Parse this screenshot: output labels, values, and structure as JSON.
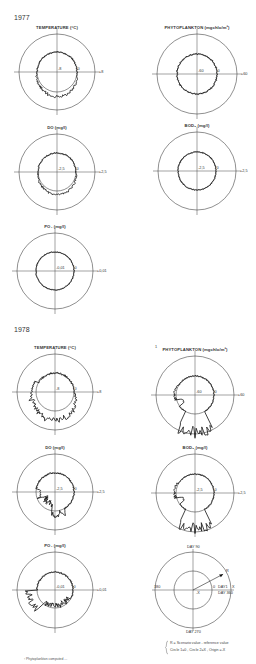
{
  "sections": [
    {
      "year": "1977",
      "y": 14
    },
    {
      "year": "1978",
      "y": 326
    }
  ],
  "panels": [
    {
      "id": "t77",
      "title": "TEMPERATURE (°C)",
      "cx": 57,
      "cy": 72,
      "r": 38,
      "ri": 20,
      "neg": "-8",
      "zero": "0",
      "pos": "+8",
      "shape": "mild_low",
      "amp": 4
    },
    {
      "id": "p77",
      "title": "PHYTOPLANKTON (mgchlo/m³)",
      "cx": 197,
      "cy": 74,
      "r": 40,
      "ri": 20,
      "neg": "-60",
      "zero": "0",
      "pos": "+60",
      "shape": "flat",
      "amp": 1.5
    },
    {
      "id": "d77",
      "title": "DO (mg/l)",
      "cx": 57,
      "cy": 172,
      "r": 38,
      "ri": 19,
      "neg": "-2,5",
      "zero": "0",
      "pos": "+2,5",
      "shape": "mild_low",
      "amp": 3
    },
    {
      "id": "b77",
      "title": "BOD₅ (mg/l)",
      "cx": 197,
      "cy": 171,
      "r": 39,
      "ri": 19,
      "neg": "-2,5",
      "zero": "0",
      "pos": "+2,5",
      "shape": "flat",
      "amp": 1
    },
    {
      "id": "o77",
      "title": "PO₄ (mg/l)",
      "cx": 55,
      "cy": 271,
      "r": 38,
      "ri": 19,
      "neg": "-0,01",
      "zero": "0",
      "pos": "+0,01",
      "shape": "flat",
      "amp": 1
    },
    {
      "id": "t78",
      "title": "TEMPERATURE (°C)",
      "cx": 55,
      "cy": 392,
      "r": 38,
      "ri": 19,
      "neg": "-8",
      "zero": "0",
      "pos": "+8",
      "shape": "big_low",
      "amp": 10
    },
    {
      "id": "p78",
      "title": "PHYTOPLANKTON (mgchlo/m³)",
      "cx": 195,
      "cy": 395,
      "r": 39,
      "ri": 19,
      "neg": "-60",
      "zero": "0",
      "pos": "+60",
      "shape": "spike",
      "amp": 20,
      "footmark": "1"
    },
    {
      "id": "d78",
      "title": "DO (mg/l)",
      "cx": 55,
      "cy": 492,
      "r": 38,
      "ri": 19,
      "neg": "-2,5",
      "zero": "0",
      "pos": "+2,5",
      "shape": "in_spike",
      "amp": 10
    },
    {
      "id": "b78",
      "title": "BOD₅ (mg/l)",
      "cx": 195,
      "cy": 493,
      "r": 39,
      "ri": 19,
      "neg": "-2,5",
      "zero": "0",
      "pos": "+2,5",
      "shape": "spike",
      "amp": 18
    },
    {
      "id": "o78",
      "title": "PO₄ (mg/l)",
      "cx": 55,
      "cy": 590,
      "r": 38,
      "ri": 18,
      "neg": "-0,01",
      "zero": "0",
      "pos": "+0,01",
      "shape": "po4",
      "amp": 15
    }
  ],
  "legend": {
    "cx": 193,
    "cy": 590,
    "r": 38,
    "ri": 19,
    "day90": "DAY 90",
    "day180": "180",
    "day270": "DAY 270",
    "day1": "DAY1",
    "day360": "DAY 360",
    "r_label": "R",
    "x_label": "X",
    "neg_x": "-X",
    "zero": "0",
    "note_line1": "R = Scenario value - reference value",
    "note_line2": "Circle 1=0 , Circle 2=X , Origin =-X"
  },
  "footnote": "¹ Phytoplankton computed ..."
}
